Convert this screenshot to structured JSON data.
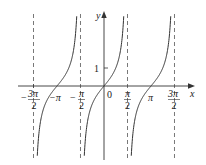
{
  "chart_data": {
    "type": "line",
    "title": "",
    "function": "y = tan x",
    "xlabel": "x",
    "ylabel": "y",
    "x_ticks": [
      {
        "value": -4.712,
        "num": "3π",
        "den": "2",
        "sign": "−"
      },
      {
        "value": -3.1416,
        "label": "−π"
      },
      {
        "value": -1.5708,
        "num": "π",
        "den": "2",
        "sign": "−"
      },
      {
        "value": 0,
        "label": "0"
      },
      {
        "value": 1.5708,
        "num": "π",
        "den": "2",
        "sign": ""
      },
      {
        "value": 3.1416,
        "label": "π"
      },
      {
        "value": 4.712,
        "num": "3π",
        "den": "2",
        "sign": ""
      }
    ],
    "y_ticks": [
      {
        "value": 1,
        "label": "1"
      }
    ],
    "asymptotes": [
      -4.712,
      -1.5708,
      1.5708,
      4.712
    ],
    "branches": [
      {
        "center": -3.1416,
        "range": [
          -4.712,
          -1.5708
        ]
      },
      {
        "center": 0,
        "range": [
          -1.5708,
          1.5708
        ]
      },
      {
        "center": 3.1416,
        "range": [
          1.5708,
          4.712
        ]
      }
    ],
    "xlim": [
      -5.2,
      5.8
    ],
    "ylim": [
      -4,
      4
    ],
    "grid": false,
    "legend": null
  },
  "labels": {
    "x_axis": "x",
    "y_axis": "y",
    "origin": "0",
    "y_one": "1",
    "neg_pi": "−π",
    "pi": "π",
    "neg_3pi2_num": "3π",
    "neg_pi2_num": "π",
    "pi2_num": "π",
    "pos_3pi2_num": "3π",
    "den": "2",
    "minus": "−"
  },
  "colors": {
    "curve": "#333333",
    "axis": "#333333",
    "asymptote": "#555555"
  }
}
